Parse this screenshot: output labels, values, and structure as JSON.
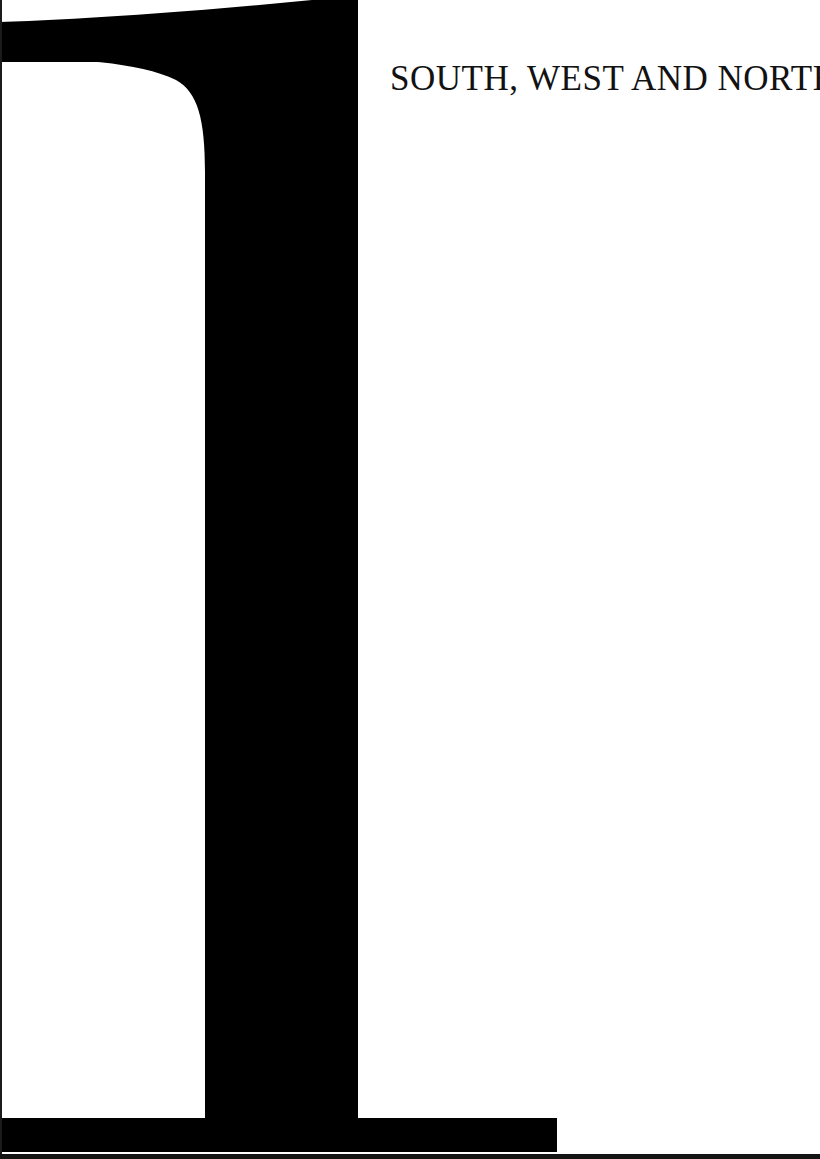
{
  "page": {
    "width": 820,
    "height": 1159,
    "background_color": "#ffffff",
    "ink_color": "#000000",
    "kind": "scanned-book-page",
    "body_text": ""
  },
  "heading": {
    "text": "SOUTH, WEST AND NORTH",
    "style": "serif-small-caps-title",
    "color": "#121212"
  },
  "dropcap": {
    "letter": "L",
    "style": "didone-serif",
    "color": "#000000",
    "description": "oversized decorative drop capital letter L spanning the full page height"
  },
  "scan_artifacts": {
    "left_edge_label": "scan edge line",
    "bottom_edge_label": "scan edge line",
    "edge_color": "#141414"
  }
}
